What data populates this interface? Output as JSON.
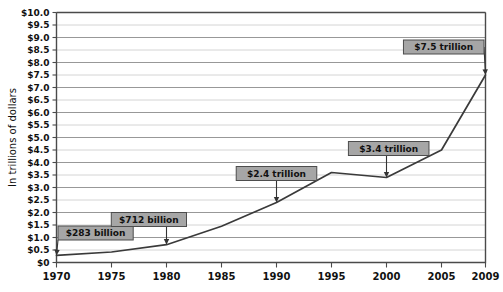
{
  "chart_data": {
    "type": "line",
    "title": "",
    "subtitle": "",
    "xlabel": "",
    "ylabel": "In trillions of dollars",
    "xlim": [
      1970,
      2009
    ],
    "ylim": [
      0,
      10
    ],
    "grid": true,
    "legend": "none",
    "x_tick_labels": [
      "1970",
      "1975",
      "1980",
      "1985",
      "1990",
      "1995",
      "2000",
      "2005",
      "2009"
    ],
    "x_tick_values": [
      1970,
      1975,
      1980,
      1985,
      1990,
      1995,
      2000,
      2005,
      2009
    ],
    "y_tick_labels": [
      "$0",
      "$0.5",
      "$1.0",
      "$1.5",
      "$2.0",
      "$2.5",
      "$3.0",
      "$3.5",
      "$4.0",
      "$4.5",
      "$5.0",
      "$5.5",
      "$6.0",
      "$6.5",
      "$7.0",
      "$7.5",
      "$8.0",
      "$8.5",
      "$9.0",
      "$9.5",
      "$10.0"
    ],
    "y_tick_values": [
      0,
      0.5,
      1.0,
      1.5,
      2.0,
      2.5,
      3.0,
      3.5,
      4.0,
      4.5,
      5.0,
      5.5,
      6.0,
      6.5,
      7.0,
      7.5,
      8.0,
      8.5,
      9.0,
      9.5,
      10.0
    ],
    "series": [
      {
        "name": "Total",
        "color": "#3a3a3a",
        "x": [
          1970,
          1975,
          1980,
          1985,
          1990,
          1995,
          2000,
          2005,
          2009
        ],
        "values": [
          0.283,
          0.42,
          0.712,
          1.45,
          2.4,
          3.6,
          3.4,
          4.5,
          7.5
        ]
      }
    ],
    "annotations": [
      {
        "label": "$283 billion",
        "x": 1970,
        "y": 0.283,
        "box_x": 1971.4,
        "box_y": 1.18
      },
      {
        "label": "$712 billion",
        "x": 1980,
        "y": 0.712,
        "box_x": 1978.4,
        "box_y": 1.72
      },
      {
        "label": "$2.4 trillion",
        "x": 1990,
        "y": 2.4,
        "box_x": 1990.0,
        "box_y": 3.56
      },
      {
        "label": "$3.4 trillion",
        "x": 2000,
        "y": 3.4,
        "box_x": 2000.2,
        "box_y": 4.56
      },
      {
        "label": "$7.5 trillion",
        "x": 2009,
        "y": 7.5,
        "box_x": 2005.9,
        "box_y": 8.62
      }
    ]
  },
  "colors": {
    "line": "#3a3a3a",
    "grid_major": "#8c8c8c",
    "grid_minor": "#c9c9c9",
    "axis": "#4a4a4a",
    "annotation_fill": "#a6a6a6",
    "annotation_border": "#4d4d4d",
    "background": "#ffffff"
  }
}
